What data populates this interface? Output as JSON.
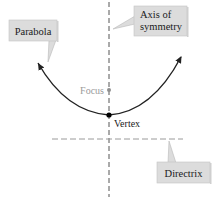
{
  "diagram": {
    "type": "parabola-anatomy",
    "labels": {
      "parabola": "Parabola",
      "axis_line1": "Axis of",
      "axis_line2": "symmetry",
      "focus": "Focus",
      "vertex": "Vertex",
      "directrix": "Directrix"
    },
    "colors": {
      "curve": "#222222",
      "axis": "#555555",
      "directrix": "#9a9a9a",
      "focus": "#8f8f8f",
      "focus_text": "#9a9a9a",
      "vertex": "#000000",
      "callout_fill": "#dcdcdc",
      "callout_border": "#b8b8b8",
      "text": "#1a1a1a"
    },
    "points": {
      "vertex": [
        109,
        115
      ],
      "focus": [
        109,
        90
      ]
    }
  }
}
